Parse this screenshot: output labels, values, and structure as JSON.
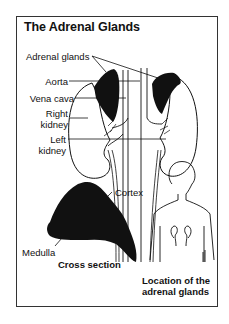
{
  "figure": {
    "title": "The Adrenal Glands",
    "labels": {
      "adrenal_glands": "Adrenal glands",
      "aorta": "Aorta",
      "vena_cava": "Vena cava",
      "right_kidney_line1": "Right",
      "right_kidney_line2": "kidney",
      "left_kidney_line1": "Left",
      "left_kidney_line2": "kidney",
      "cortex": "Cortex",
      "medulla": "Medulla",
      "cross_section": "Cross section",
      "location_line1": "Location of the",
      "location_line2": "adrenal glands"
    },
    "colors": {
      "ink": "#111111",
      "frame": "#333333",
      "background": "#ffffff"
    }
  }
}
